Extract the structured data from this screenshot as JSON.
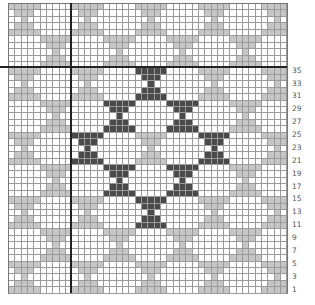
{
  "chart": {
    "title": "",
    "type": "knitting-colorwork-chart",
    "columns": 44,
    "rows": 45,
    "cell_width": 6.34,
    "cell_height": 6.44,
    "motif": {
      "name": "bowtie",
      "size": 5,
      "row_widths": [
        5,
        3,
        1,
        3,
        5
      ],
      "repeat": 10,
      "offsets": [
        [
          0,
          0
        ],
        [
          5,
          5
        ]
      ]
    },
    "dark_motifs": [
      {
        "row": 10,
        "col": 20
      },
      {
        "row": 15,
        "col": 15
      },
      {
        "row": 15,
        "col": 25
      },
      {
        "row": 20,
        "col": 10
      },
      {
        "row": 20,
        "col": 30
      },
      {
        "row": 25,
        "col": 15
      },
      {
        "row": 25,
        "col": 25
      },
      {
        "row": 30,
        "col": 20
      }
    ],
    "heavy_lines": {
      "vertical_after_col": 10,
      "horizontal_after_row": 10
    },
    "row_labels": [
      {
        "label": "35",
        "row": 10
      },
      {
        "label": "33",
        "row": 12
      },
      {
        "label": "31",
        "row": 14
      },
      {
        "label": "29",
        "row": 16
      },
      {
        "label": "27",
        "row": 18
      },
      {
        "label": "25",
        "row": 20
      },
      {
        "label": "23",
        "row": 22
      },
      {
        "label": "21",
        "row": 24
      },
      {
        "label": "19",
        "row": 26
      },
      {
        "label": "17",
        "row": 28
      },
      {
        "label": "15",
        "row": 30
      },
      {
        "label": "13",
        "row": 32
      },
      {
        "label": "11",
        "row": 34
      },
      {
        "label": "9",
        "row": 36
      },
      {
        "label": "7",
        "row": 38
      },
      {
        "label": "5",
        "row": 40
      },
      {
        "label": "3",
        "row": 42
      },
      {
        "label": "1",
        "row": 44
      }
    ],
    "colors": {
      "light": "#c6c6c6",
      "dark": "#4a4a4a",
      "background": "#ffffff",
      "grid": "#9a9a9a",
      "heavy_line": "#222222"
    }
  }
}
